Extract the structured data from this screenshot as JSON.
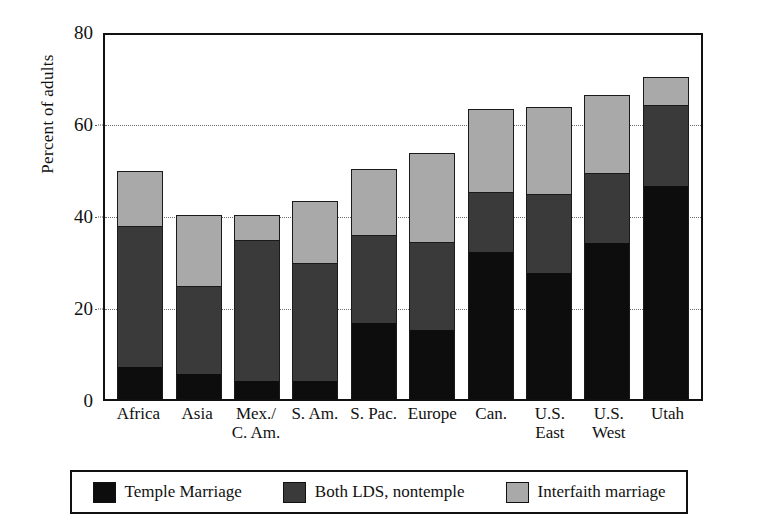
{
  "chart_data": {
    "type": "bar",
    "subtype": "stacked-vertical",
    "title": "",
    "xlabel": "",
    "ylabel": "Percent of adults",
    "ylim": [
      0,
      80
    ],
    "yticks": [
      0,
      20,
      40,
      60,
      80
    ],
    "ytick_labels": [
      "0",
      "20",
      "40",
      "60",
      "80"
    ],
    "grid": "horizontal-dotted",
    "legend_position": "bottom",
    "categories": [
      "Africa",
      "Asia",
      "Mex./ C. Am.",
      "S. Am.",
      "S. Pac.",
      "Europe",
      "Can.",
      "U.S. East",
      "U.S. West",
      "Utah"
    ],
    "category_lines": [
      [
        "Africa"
      ],
      [
        "Asia"
      ],
      [
        "Mex./",
        "C. Am."
      ],
      [
        "S. Am."
      ],
      [
        "S. Pac."
      ],
      [
        "Europe"
      ],
      [
        "Can."
      ],
      [
        "U.S.",
        "East"
      ],
      [
        "U.S.",
        "West"
      ],
      [
        "Utah"
      ]
    ],
    "series": [
      {
        "name": "Temple Marriage",
        "color": "#0d0d0d",
        "values": [
          7,
          5.5,
          4,
          4,
          16.5,
          15,
          32,
          27.5,
          34,
          46.5
        ]
      },
      {
        "name": "Both LDS, nontemple",
        "color": "#3a3a3a",
        "values": [
          30.5,
          19,
          30.5,
          25.5,
          19,
          19,
          13,
          17,
          15,
          17.5
        ]
      },
      {
        "name": "Interfaith marriage",
        "color": "#a9a9a9",
        "values": [
          12,
          15.5,
          5.5,
          13.5,
          14.5,
          19.5,
          18,
          19,
          17,
          6
        ]
      }
    ],
    "totals": [
      49.5,
      40,
      40,
      43,
      50,
      53.5,
      63,
      63.5,
      66,
      70
    ]
  },
  "legend": {
    "items": [
      {
        "label": "Temple Marriage",
        "swatch_class": "sw-temple"
      },
      {
        "label": "Both LDS, nontemple",
        "swatch_class": "sw-bothlds"
      },
      {
        "label": "Interfaith marriage",
        "swatch_class": "sw-interfaith"
      }
    ]
  }
}
